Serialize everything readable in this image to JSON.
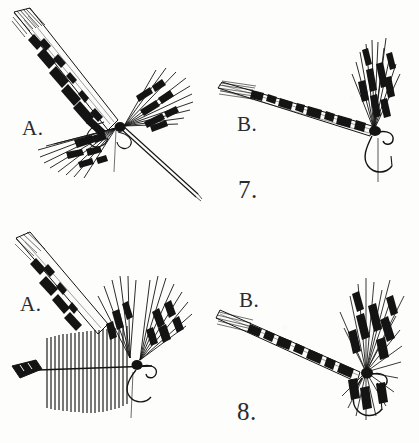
{
  "plate": {
    "title": "Fly-tying illustration plate",
    "medium": "pen-and-ink line engraving",
    "background_color": "#fdfdfc",
    "ink_color": "#1a1a1a",
    "panel_count": 4
  },
  "figures": [
    {
      "number_label": "7.",
      "steps": [
        {
          "letter_label": "A.",
          "name": "wing-feather-tied-in-flared",
          "description": "Barred wing feather slip angled up to the left with a second flared hackle bunch at the hook head and a long exposed hook shank running down to the right.",
          "elements": [
            "barred-feather-wing",
            "flared-hackle-bunch",
            "thread-loop",
            "hook-shank",
            "hook-point"
          ]
        },
        {
          "letter_label": "B.",
          "name": "wing-set-upright",
          "description": "Same fly with the barred wing laid horizontally to the left and the hackle fibers drawn upright above the hook eye, thread wrapped at the head.",
          "elements": [
            "barred-feather-wing",
            "upright-wing-bunch",
            "thread-head-wrap",
            "hook-eye",
            "hook-bend"
          ]
        }
      ]
    },
    {
      "number_label": "8.",
      "steps": [
        {
          "letter_label": "A.",
          "name": "hackle-feather-prepared",
          "description": "Hackle feather held flat with barbs standing vertically from a horizontal stem and a dark feather tip at the left, shown below two divided wing bunches.",
          "elements": [
            "hackle-feather-comb",
            "feather-stem",
            "dark-feather-tip",
            "divided-wing-bunches",
            "hook-shank"
          ]
        },
        {
          "letter_label": "B.",
          "name": "finished-hackled-fly",
          "description": "Completed fly with barred wing extending left and dense hackle radiating around the head above the hook bend.",
          "elements": [
            "barred-feather-wing",
            "radiating-hackle-collar",
            "thread-head-wrap",
            "hook-eye",
            "hook-bend",
            "hook-point"
          ]
        }
      ]
    }
  ],
  "captions": {
    "fig7_step_a": "A.",
    "fig7_step_b": "B.",
    "fig7_number": "7.",
    "fig8_step_a": "A.",
    "fig8_step_b": "B.",
    "fig8_number": "8."
  }
}
